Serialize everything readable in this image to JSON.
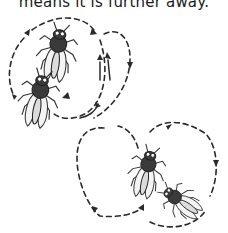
{
  "caption": {
    "text": "means it is further away."
  },
  "illustration": {
    "groups": [
      {
        "name": "top-left-pair",
        "insects": 2,
        "flight_path": "dashed loop"
      },
      {
        "name": "bottom-right-pair",
        "insects": 2,
        "flight_path": "dashed figure-eight"
      }
    ],
    "colors": {
      "ink": "#2a2a2a",
      "insect_body": "#3a3a3a",
      "wing": "#f4f4f4",
      "background": "#ffffff"
    }
  }
}
